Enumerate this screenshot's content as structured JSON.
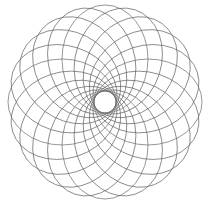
{
  "figure": {
    "background_color": "#ffffff",
    "stroke_color": "#6a6a6a",
    "stroke_width": 0.7,
    "canvas": {
      "width": 210,
      "height": 206
    }
  },
  "chart_data": {
    "type": "line",
    "subtitle": "",
    "xlabel": "",
    "ylabel": "",
    "grid": false,
    "legend": null,
    "axes_visible": false,
    "xlim": [
      8,
      202
    ],
    "ylim": [
      8,
      196
    ],
    "geometry": {
      "pattern": "rotational-ellipse-rosette",
      "center_x": 105,
      "center_y": 102,
      "outer_radius": 97,
      "inner_hole_radius": 11,
      "ellipse_count": 20,
      "ellipse_semi_major": 54,
      "ellipse_semi_minor": 43,
      "ellipse_center_offset": 43,
      "rotation_step_degrees": 18,
      "start_angle_degrees": 0
    },
    "series": [
      {
        "name": "ellipse-01",
        "rotation_deg": 0
      },
      {
        "name": "ellipse-02",
        "rotation_deg": 18
      },
      {
        "name": "ellipse-03",
        "rotation_deg": 36
      },
      {
        "name": "ellipse-04",
        "rotation_deg": 54
      },
      {
        "name": "ellipse-05",
        "rotation_deg": 72
      },
      {
        "name": "ellipse-06",
        "rotation_deg": 90
      },
      {
        "name": "ellipse-07",
        "rotation_deg": 108
      },
      {
        "name": "ellipse-08",
        "rotation_deg": 126
      },
      {
        "name": "ellipse-09",
        "rotation_deg": 144
      },
      {
        "name": "ellipse-10",
        "rotation_deg": 162
      },
      {
        "name": "ellipse-11",
        "rotation_deg": 180
      },
      {
        "name": "ellipse-12",
        "rotation_deg": 198
      },
      {
        "name": "ellipse-13",
        "rotation_deg": 216
      },
      {
        "name": "ellipse-14",
        "rotation_deg": 234
      },
      {
        "name": "ellipse-15",
        "rotation_deg": 252
      },
      {
        "name": "ellipse-16",
        "rotation_deg": 270
      },
      {
        "name": "ellipse-17",
        "rotation_deg": 288
      },
      {
        "name": "ellipse-18",
        "rotation_deg": 306
      },
      {
        "name": "ellipse-19",
        "rotation_deg": 324
      },
      {
        "name": "ellipse-20",
        "rotation_deg": 342
      }
    ]
  }
}
